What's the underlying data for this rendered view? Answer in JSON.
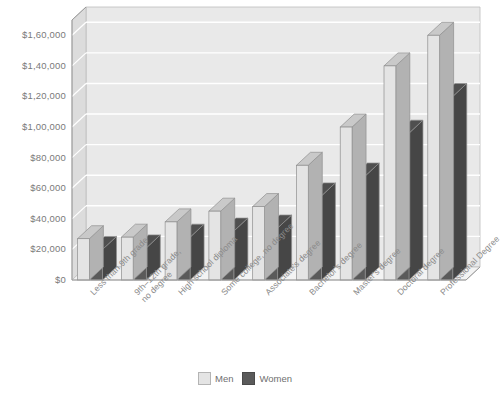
{
  "chart_data": {
    "type": "bar",
    "title": "",
    "xlabel": "",
    "ylabel": "",
    "ylim": [
      0,
      170000
    ],
    "grid": true,
    "legend_position": "bottom",
    "style": "3d-clustered-column",
    "categories": [
      "Less than 9th grade",
      "9th–12th grade, no degree",
      "High school diploma",
      "Some college, no degree",
      "Associate's degree",
      "Bachelor's degree",
      "Master's degree",
      "Doctoral degree",
      "Professional Degree"
    ],
    "category_lines": [
      [
        "Less than 9th grade"
      ],
      [
        "9th–12th grade,",
        "no degree"
      ],
      [
        "High school diploma"
      ],
      [
        "Some college, no degree"
      ],
      [
        "Associate's degree"
      ],
      [
        "Bachelor's degree"
      ],
      [
        "Master's degree"
      ],
      [
        "Doctoral degree"
      ],
      [
        "Professional Degree"
      ]
    ],
    "series": [
      {
        "name": "Men",
        "color": "#e4e4e4",
        "values": [
          27000,
          28000,
          38000,
          45000,
          48000,
          75000,
          100000,
          140000,
          160000
        ]
      },
      {
        "name": "Women",
        "color": "#5a5a5a",
        "values": [
          20000,
          21000,
          28000,
          32000,
          34000,
          55000,
          68000,
          96000,
          120000
        ]
      }
    ],
    "ytick_values": [
      0,
      20000,
      40000,
      60000,
      80000,
      100000,
      120000,
      140000,
      160000
    ],
    "ytick_labels": [
      "$0",
      "$20,000",
      "$40,000",
      "$60,000",
      "$80,000",
      "$1,00,000",
      "$1,20,000",
      "$1,40,000",
      "$1,60,000"
    ]
  },
  "legend": {
    "men_label": "Men",
    "women_label": "Women"
  },
  "caption": {
    "text": ""
  },
  "colors": {
    "plot_wall": "#e9e9e9",
    "gridline": "#ffffff",
    "men": "#e4e4e4",
    "women": "#5a5a5a",
    "axis_text": "#7a7a7a"
  }
}
